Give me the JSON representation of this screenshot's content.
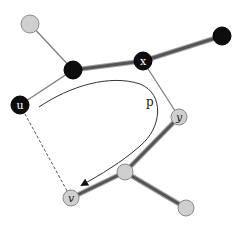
{
  "diagram": {
    "title": "",
    "colors": {
      "background": "#ffffff",
      "black_node": "#0d0d0d",
      "gray_node": "#cfcfcf",
      "gray_node_stroke": "#8a8a8a",
      "thick_edge": "#555555",
      "thin_edge": "#777777",
      "path_curve": "#333333",
      "dashed_edge": "#555555"
    },
    "nodes": [
      {
        "id": "n_top_left",
        "label": "",
        "x": 30,
        "y": 24,
        "r": 9,
        "fill": "gray"
      },
      {
        "id": "u",
        "label": "u",
        "x": 20,
        "y": 105,
        "r": 9,
        "fill": "black"
      },
      {
        "id": "n_a",
        "label": "",
        "x": 73,
        "y": 70,
        "r": 9,
        "fill": "black"
      },
      {
        "id": "x",
        "label": "x",
        "x": 143,
        "y": 61,
        "r": 9,
        "fill": "black"
      },
      {
        "id": "n_top_right",
        "label": "",
        "x": 222,
        "y": 36,
        "r": 9,
        "fill": "black"
      },
      {
        "id": "y",
        "label": "y",
        "x": 179,
        "y": 117,
        "r": 8,
        "fill": "gray"
      },
      {
        "id": "n_mid",
        "label": "",
        "x": 125,
        "y": 172,
        "r": 8,
        "fill": "gray"
      },
      {
        "id": "v",
        "label": "v",
        "x": 71,
        "y": 198,
        "r": 8,
        "fill": "gray"
      },
      {
        "id": "n_bottom_right",
        "label": "",
        "x": 186,
        "y": 208,
        "r": 8,
        "fill": "gray"
      }
    ],
    "edges": [
      {
        "from": "n_top_left",
        "to": "n_a",
        "style": "thin"
      },
      {
        "from": "u",
        "to": "n_a",
        "style": "thin"
      },
      {
        "from": "n_a",
        "to": "x",
        "style": "thick"
      },
      {
        "from": "x",
        "to": "n_top_right",
        "style": "thick"
      },
      {
        "from": "x",
        "to": "y",
        "style": "thin"
      },
      {
        "from": "y",
        "to": "n_mid",
        "style": "thick"
      },
      {
        "from": "n_mid",
        "to": "v",
        "style": "thick"
      },
      {
        "from": "n_mid",
        "to": "n_bottom_right",
        "style": "thick"
      },
      {
        "from": "u",
        "to": "v",
        "style": "dashed"
      }
    ],
    "path": {
      "label": "p",
      "label_x": 146,
      "label_y": 106,
      "d": "M 39 107 C 70 86, 110 74, 140 84 C 165 94, 162 128, 140 146 C 122 162, 100 175, 82 185"
    }
  }
}
